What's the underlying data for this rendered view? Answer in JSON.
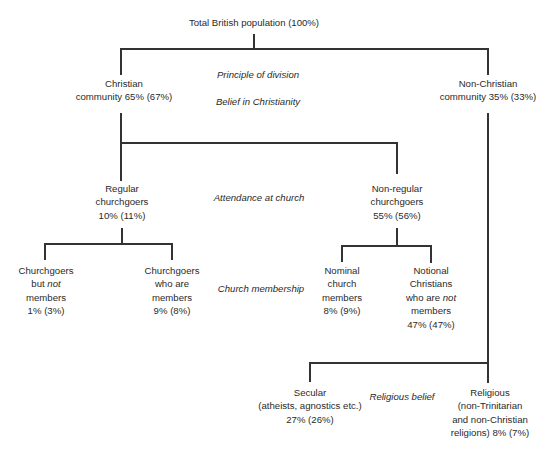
{
  "diagram": {
    "root": {
      "label": "Total British population (100%)"
    },
    "principles": {
      "header": "Principle of division",
      "level1": "Belief in Christianity",
      "level2": "Attendance at church",
      "level3": "Church membership",
      "level4": "Religious belief"
    },
    "nodes": {
      "christian": {
        "line1": "Christian",
        "line2": "community 65% (67%)"
      },
      "non_christian": {
        "line1": "Non-Christian",
        "line2": "community 35% (33%)"
      },
      "regular": {
        "line1": "Regular",
        "line2": "churchgoers",
        "line3": "10% (11%)"
      },
      "non_regular": {
        "line1": "Non-regular",
        "line2": "churchgoers",
        "line3": "55% (56%)"
      },
      "churchgoers_not_members": {
        "line1": "Churchgoers",
        "line2_pre": "but ",
        "line2_em": "not",
        "line3": "members",
        "line4": "1% (3%)"
      },
      "churchgoers_members": {
        "line1": "Churchgoers",
        "line2": "who are",
        "line3": "members",
        "line4": "9% (8%)"
      },
      "nominal_members": {
        "line1": "Nominal",
        "line2": "church",
        "line3": "members",
        "line4": "8% (9%)"
      },
      "notional_christians": {
        "line1": "Notional",
        "line2": "Christians",
        "line3_pre": "who are ",
        "line3_em": "not",
        "line4": "members",
        "line5": "47% (47%)"
      },
      "secular": {
        "line1": "Secular",
        "line2": "(atheists, agnostics etc.)",
        "line3": "27% (26%)"
      },
      "religious": {
        "line1": "Religious",
        "line2": "(non-Trinitarian",
        "line3": "and non-Christian",
        "line4": "religions) 8% (7%)"
      }
    },
    "colors": {
      "line": "#333333",
      "text": "#2a2a2a",
      "background": "#ffffff"
    }
  }
}
